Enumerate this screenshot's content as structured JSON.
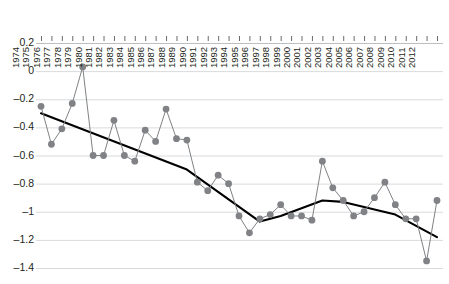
{
  "chart_data": {
    "type": "line",
    "title": "",
    "subtitle": "",
    "xlabel": "",
    "ylabel": "",
    "grid": true,
    "legend": "none",
    "xlim": [
      1974,
      2012
    ],
    "ylim": [
      -1.4,
      0.2
    ],
    "ytick_labels": [
      "0.2",
      "0",
      "-0.2",
      "-0.4",
      "-0.6",
      "-0.8",
      "-1",
      "-1.2",
      "-1.4"
    ],
    "ytick_values": [
      0.2,
      0,
      -0.2,
      -0.4,
      -0.6,
      -0.8,
      -1,
      -1.2,
      -1.4
    ],
    "categories": [
      "1974",
      "1975",
      "1976",
      "1977",
      "1978",
      "1979",
      "1980",
      "1981",
      "1982",
      "1983",
      "1984",
      "1985",
      "1986",
      "1987",
      "1988",
      "1989",
      "1990",
      "1991",
      "1992",
      "1993",
      "1994",
      "1995",
      "1996",
      "1997",
      "1998",
      "1999",
      "2000",
      "2001",
      "2002",
      "2003",
      "2004",
      "2005",
      "2006",
      "2007",
      "2008",
      "2009",
      "2010",
      "2011",
      "2012"
    ],
    "series": [
      {
        "name": "annual series",
        "type": "line-markers",
        "color": "#808285",
        "marker": "circle",
        "values": [
          -0.25,
          -0.52,
          -0.41,
          -0.23,
          0.03,
          -0.6,
          -0.6,
          -0.35,
          -0.6,
          -0.64,
          -0.42,
          -0.5,
          -0.27,
          -0.48,
          -0.49,
          -0.79,
          -0.85,
          -0.74,
          -0.8,
          -1.03,
          -1.15,
          -1.05,
          -1.02,
          -0.95,
          -1.03,
          -1.03,
          -1.06,
          -0.64,
          -0.83,
          -0.92,
          -1.03,
          -1.0,
          -0.9,
          -0.79,
          -0.95,
          -1.05,
          -1.05,
          -1.35,
          -0.92
        ]
      },
      {
        "name": "trend line",
        "type": "line",
        "color": "#000000",
        "marker": "none",
        "points": [
          {
            "x": "1974",
            "y": -0.3
          },
          {
            "x": "1988",
            "y": -0.7
          },
          {
            "x": "1995",
            "y": -1.07
          },
          {
            "x": "1997",
            "y": -1.03
          },
          {
            "x": "2001",
            "y": -0.92
          },
          {
            "x": "2003",
            "y": -0.93
          },
          {
            "x": "2008",
            "y": -1.02
          },
          {
            "x": "2012",
            "y": -1.18
          }
        ]
      }
    ]
  }
}
